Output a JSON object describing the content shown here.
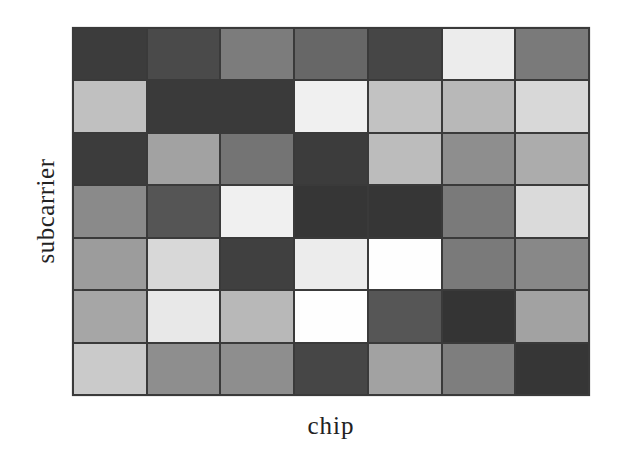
{
  "chart_data": {
    "type": "heatmap",
    "title": "",
    "xlabel": "chip",
    "ylabel": "subcarrier",
    "rows": 7,
    "cols": 7,
    "colormap": "grayscale",
    "grid": true,
    "legend": null,
    "values_gray_hex": [
      [
        "#3c3c3c",
        "#4a4a4a",
        "#7c7c7c",
        "#676767",
        "#464646",
        "#ececec",
        "#7a7a7a"
      ],
      [
        "#c0c0c0",
        "#3a3a3a",
        "#3a3a3a",
        "#f0f0f0",
        "#c2c2c2",
        "#b8b8b8",
        "#d8d8d8"
      ],
      [
        "#3c3c3c",
        "#a2a2a2",
        "#747474",
        "#3c3c3c",
        "#bcbcbc",
        "#8e8e8e",
        "#acacac"
      ],
      [
        "#8a8a8a",
        "#555555",
        "#f0f0f0",
        "#363636",
        "#363636",
        "#7a7a7a",
        "#dadada"
      ],
      [
        "#9c9c9c",
        "#d8d8d8",
        "#404040",
        "#ececec",
        "#fefefe",
        "#7a7a7a",
        "#888888"
      ],
      [
        "#a6a6a6",
        "#e8e8e8",
        "#b8b8b8",
        "#fefefe",
        "#565656",
        "#343434",
        "#a2a2a2"
      ],
      [
        "#cacaca",
        "#8e8e8e",
        "#8e8e8e",
        "#464646",
        "#a2a2a2",
        "#7e7e7e",
        "#363636"
      ]
    ],
    "values_intensity": [
      [
        0.24,
        0.29,
        0.49,
        0.4,
        0.27,
        0.93,
        0.48
      ],
      [
        0.75,
        0.23,
        0.23,
        0.94,
        0.76,
        0.72,
        0.85
      ],
      [
        0.24,
        0.64,
        0.45,
        0.24,
        0.74,
        0.56,
        0.67
      ],
      [
        0.54,
        0.33,
        0.94,
        0.21,
        0.21,
        0.48,
        0.85
      ],
      [
        0.61,
        0.85,
        0.25,
        0.93,
        1.0,
        0.48,
        0.53
      ],
      [
        0.65,
        0.91,
        0.72,
        1.0,
        0.34,
        0.2,
        0.64
      ],
      [
        0.79,
        0.56,
        0.56,
        0.27,
        0.64,
        0.49,
        0.21
      ]
    ]
  }
}
